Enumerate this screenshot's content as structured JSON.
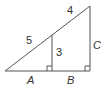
{
  "diagram": {
    "type": "similar-right-triangles",
    "colors": {
      "stroke": "#555555",
      "text": "#333333",
      "background": "#ffffff"
    },
    "labels": {
      "hyp_lower": "5",
      "hyp_upper": "4",
      "inner_leg": "3",
      "outer_leg": "C",
      "base_left": "A",
      "base_right": "B"
    }
  }
}
